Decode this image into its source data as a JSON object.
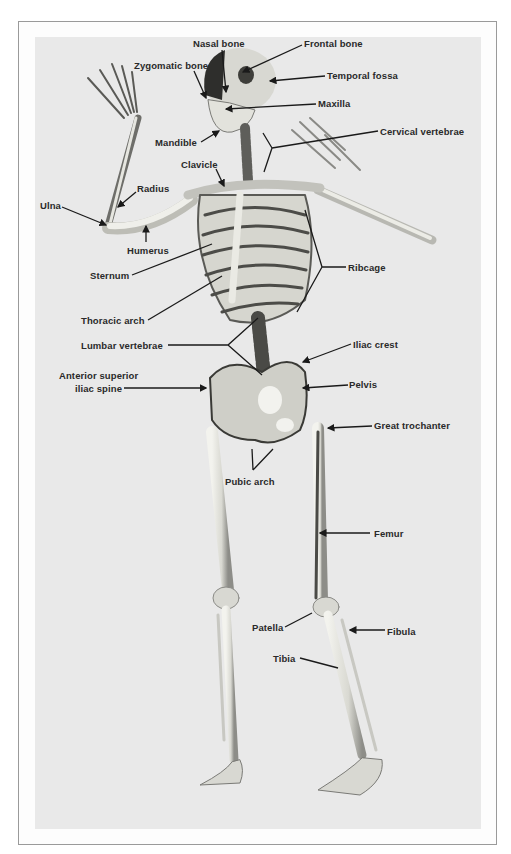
{
  "figure": {
    "colors": {
      "background": "#e9e9e9",
      "frame": "#9a9a9a",
      "bone": "#dcdcd4",
      "bone_shadow": "#6a6a66",
      "label_text": "#2a2a2a",
      "leader_line": "#1a1a1a"
    },
    "labels": [
      {
        "id": "nasal-bone",
        "text": "Nasal bone",
        "x": 193,
        "y": 38
      },
      {
        "id": "frontal-bone",
        "text": "Frontal bone",
        "x": 304,
        "y": 38
      },
      {
        "id": "zygomatic-bone",
        "text": "Zygomatic bone",
        "x": 134,
        "y": 60
      },
      {
        "id": "temporal-fossa",
        "text": "Temporal fossa",
        "x": 327,
        "y": 70
      },
      {
        "id": "maxilla",
        "text": "Maxilla",
        "x": 318,
        "y": 98
      },
      {
        "id": "mandible",
        "text": "Mandible",
        "x": 155,
        "y": 137
      },
      {
        "id": "cervical-vertebrae",
        "text": "Cervical vertebrae",
        "x": 380,
        "y": 126
      },
      {
        "id": "clavicle",
        "text": "Clavicle",
        "x": 181,
        "y": 159
      },
      {
        "id": "radius",
        "text": "Radius",
        "x": 137,
        "y": 183
      },
      {
        "id": "ulna",
        "text": "Ulna",
        "x": 40,
        "y": 200
      },
      {
        "id": "humerus",
        "text": "Humerus",
        "x": 127,
        "y": 245
      },
      {
        "id": "sternum",
        "text": "Sternum",
        "x": 90,
        "y": 270
      },
      {
        "id": "ribcage",
        "text": "Ribcage",
        "x": 348,
        "y": 262
      },
      {
        "id": "thoracic-arch",
        "text": "Thoracic arch",
        "x": 81,
        "y": 315
      },
      {
        "id": "lumbar-vertebrae",
        "text": "Lumbar vertebrae",
        "x": 81,
        "y": 340
      },
      {
        "id": "anterior-superior-iliac-spine-1",
        "text": "Anterior superior",
        "x": 59,
        "y": 370
      },
      {
        "id": "anterior-superior-iliac-spine-2",
        "text": "iliac spine",
        "x": 75,
        "y": 383
      },
      {
        "id": "iliac-crest",
        "text": "Iliac crest",
        "x": 353,
        "y": 339
      },
      {
        "id": "pelvis",
        "text": "Pelvis",
        "x": 349,
        "y": 379
      },
      {
        "id": "great-trochanter",
        "text": "Great trochanter",
        "x": 374,
        "y": 420
      },
      {
        "id": "pubic-arch",
        "text": "Pubic arch",
        "x": 225,
        "y": 476
      },
      {
        "id": "femur",
        "text": "Femur",
        "x": 374,
        "y": 528
      },
      {
        "id": "patella",
        "text": "Patella",
        "x": 252,
        "y": 622
      },
      {
        "id": "fibula",
        "text": "Fibula",
        "x": 387,
        "y": 626
      },
      {
        "id": "tibia",
        "text": "Tibia",
        "x": 273,
        "y": 653
      }
    ]
  }
}
